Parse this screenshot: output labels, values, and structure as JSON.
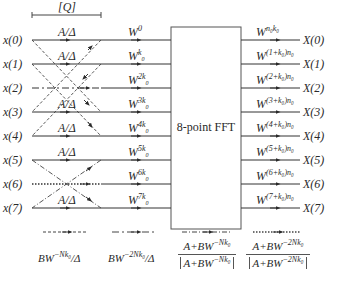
{
  "bracket_label": "[Q]",
  "fft_label": "8-point FFT",
  "inputs": [
    "x(0)",
    "x(1)",
    "x(2)",
    "x(3)",
    "x(4)",
    "x(5)",
    "x(6)",
    "x(7)"
  ],
  "outputs": [
    "X(0)",
    "X(1)",
    "X(2)",
    "X(3)",
    "X(4)",
    "X(5)",
    "X(6)",
    "X(7)"
  ],
  "branch_gain": "A/Δ",
  "branch_gain_rows": [
    0,
    1,
    3,
    4,
    5,
    7
  ],
  "twiddles_in": [
    {
      "base": "W",
      "exp": "0"
    },
    {
      "base": "W",
      "exp": "k",
      "sub": "0"
    },
    {
      "base": "W",
      "exp": "2k",
      "sub": "0"
    },
    {
      "base": "W",
      "exp": "3k",
      "sub": "0"
    },
    {
      "base": "W",
      "exp": "4k",
      "sub": "0"
    },
    {
      "base": "W",
      "exp": "5k",
      "sub": "0"
    },
    {
      "base": "W",
      "exp": "6k",
      "sub": "0"
    },
    {
      "base": "W",
      "exp": "7k",
      "sub": "0"
    }
  ],
  "twiddles_out": [
    {
      "base": "W",
      "exp": "n₀k₀"
    },
    {
      "base": "W",
      "exp": "(1+k₀)n₀"
    },
    {
      "base": "W",
      "exp": "(2+k₀)n₀"
    },
    {
      "base": "W",
      "exp": "(3+k₀)n₀"
    },
    {
      "base": "W",
      "exp": "(4+k₀)n₀"
    },
    {
      "base": "W",
      "exp": "(5+k₀)n₀"
    },
    {
      "base": "W",
      "exp": "(6+k₀)n₀"
    },
    {
      "base": "W",
      "exp": "(7+k₀)n₀"
    }
  ],
  "legend": [
    {
      "style": "dashed",
      "label_base": "BW",
      "label_exp": "−Nk₀",
      "label_tail": "/Δ"
    },
    {
      "style": "dash-dot-long",
      "label_base": "BW",
      "label_exp": "−2Nk₀",
      "label_tail": "/Δ"
    },
    {
      "style": "dash-dot",
      "num": "A+BW⁻ᴺᵏ⁰",
      "num_base": "A+BW",
      "num_exp": "−Nk₀",
      "den_base": "A+BW",
      "den_exp": "−Nk₀"
    },
    {
      "style": "dotted",
      "num_base": "A+BW",
      "num_exp": "−2Nk₀",
      "den_base": "A+BW",
      "den_exp": "−2Nk₀"
    }
  ],
  "colors": {
    "line": "#3a3a3a",
    "background": "#ffffff",
    "text": "#2a2a2a"
  }
}
